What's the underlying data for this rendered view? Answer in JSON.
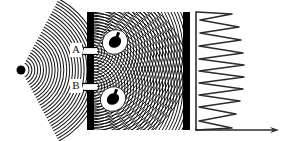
{
  "figure": {
    "background_color": "#ffffff",
    "ink_color": "#000000",
    "width": 288,
    "height": 141
  },
  "source": {
    "label": "point-source",
    "x": 21,
    "y": 70,
    "radius": 4.5,
    "color": "#000000"
  },
  "incident_wave": {
    "description": "circular wavefronts expanding from the point source toward the slit barrier",
    "center_x": 21,
    "center_y": 70,
    "ring_count": 26,
    "ring_spacing": 2.9,
    "first_radius": 8,
    "stroke_width": 1.05,
    "color": "#1a1a1a",
    "angular_half_width_deg": 62
  },
  "slit_barrier": {
    "label": "slit-barrier",
    "x": 87,
    "width": 7,
    "top": 12,
    "bottom": 130,
    "color": "#000000",
    "slits": [
      {
        "id": "A",
        "label": "A",
        "center_y": 51,
        "gap": 7
      },
      {
        "id": "B",
        "label": "B",
        "center_y": 87,
        "gap": 7
      }
    ]
  },
  "slit_labels": [
    {
      "text": "A",
      "x": 76,
      "y": 50
    },
    {
      "text": "B",
      "x": 76,
      "y": 86
    }
  ],
  "interference_region": {
    "description": "two overlapping circular wave trains emerging from slits A and B forming a moire interference pattern",
    "left": 94,
    "right": 183,
    "top": 12,
    "bottom": 130,
    "ring_count": 34,
    "ring_spacing": 2.9,
    "stroke_width": 1.0,
    "color": "#111111",
    "sources": [
      {
        "id": "A",
        "x": 92,
        "y": 51
      },
      {
        "id": "B",
        "x": 92,
        "y": 87
      }
    ]
  },
  "detectors": [
    {
      "label": "which-path-detector-upper",
      "x": 115,
      "y": 42,
      "blob_rx": 6.5,
      "blob_ry": 5.5,
      "halo_rx": 13,
      "halo_ry": 12,
      "rotation_deg": -35,
      "color": "#000000",
      "halo_color": "#ffffff"
    },
    {
      "label": "which-path-detector-lower",
      "x": 113,
      "y": 99,
      "blob_rx": 6.5,
      "blob_ry": 5.5,
      "halo_rx": 13,
      "halo_ry": 12,
      "rotation_deg": -35,
      "color": "#000000",
      "halo_color": "#ffffff"
    }
  ],
  "screen": {
    "label": "detection-screen",
    "x": 183,
    "width": 7,
    "top": 12,
    "bottom": 130,
    "color": "#000000"
  },
  "intensity_plot": {
    "label": "intensity-distribution",
    "axis_x": 196,
    "axis_top": 12,
    "axis_bottom": 130,
    "axis_color": "#2b2b2b",
    "axis_width": 1.6,
    "arrow": {
      "label": "intensity-axis-arrow",
      "x1": 196,
      "y1": 130,
      "x2": 279,
      "y2": 130,
      "head_length": 9,
      "head_width": 6
    },
    "curve_color": "#2b2b2b",
    "curve_width": 1.5
  },
  "chart_data": {
    "type": "line",
    "xlabel": "Intensity",
    "ylabel": "Position on screen",
    "orientation": "horizontal-intensity-vertical-position",
    "grid": false,
    "legend": null,
    "xlim": [
      0,
      83
    ],
    "ylim": [
      12,
      130
    ],
    "axis_origin": {
      "x": 196,
      "y": 130
    },
    "comment": "Values are peak intensities (horizontal excursions from the vertical axis, in px) at successive screen positions (y, in px from top).",
    "y": [
      14,
      20,
      27,
      33,
      40,
      46,
      53,
      59,
      65,
      71,
      77,
      83,
      89,
      95,
      101,
      107,
      114,
      121,
      128
    ],
    "values": [
      36,
      4,
      43,
      4,
      45,
      3,
      47,
      3,
      48,
      3,
      48,
      3,
      47,
      3,
      44,
      3,
      40,
      3,
      36
    ],
    "peaks": [
      {
        "position_y": 14,
        "intensity": 36
      },
      {
        "position_y": 27,
        "intensity": 43
      },
      {
        "position_y": 40,
        "intensity": 45
      },
      {
        "position_y": 53,
        "intensity": 47
      },
      {
        "position_y": 65,
        "intensity": 48
      },
      {
        "position_y": 77,
        "intensity": 48
      },
      {
        "position_y": 89,
        "intensity": 47
      },
      {
        "position_y": 101,
        "intensity": 44
      },
      {
        "position_y": 114,
        "intensity": 40
      },
      {
        "position_y": 128,
        "intensity": 36
      }
    ],
    "minima": [
      {
        "position_y": 20,
        "intensity": 4
      },
      {
        "position_y": 33,
        "intensity": 4
      },
      {
        "position_y": 46,
        "intensity": 3
      },
      {
        "position_y": 59,
        "intensity": 3
      },
      {
        "position_y": 71,
        "intensity": 3
      },
      {
        "position_y": 83,
        "intensity": 3
      },
      {
        "position_y": 95,
        "intensity": 3
      },
      {
        "position_y": 107,
        "intensity": 3
      },
      {
        "position_y": 121,
        "intensity": 3
      }
    ]
  }
}
